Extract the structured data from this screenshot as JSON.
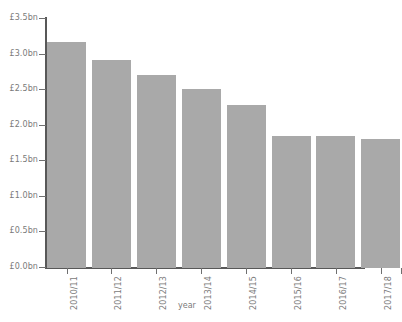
{
  "chart_data": {
    "type": "bar",
    "title": "",
    "xlabel": "year",
    "ylabel": "",
    "categories": [
      "2010/11",
      "2011/12",
      "2012/13",
      "2013/14",
      "2014/15",
      "2015/16",
      "2016/17",
      "2017/18"
    ],
    "values": [
      3.18,
      2.92,
      2.71,
      2.51,
      2.29,
      1.86,
      1.86,
      1.82
    ],
    "value_unit": "£bn",
    "ylim": [
      0,
      3.5
    ],
    "ytick_values": [
      0.0,
      0.5,
      1.0,
      1.5,
      2.0,
      2.5,
      3.0,
      3.5
    ],
    "ytick_labels": [
      "£0.0bn",
      "£0.5bn",
      "£1.0bn",
      "£1.5bn",
      "£2.0bn",
      "£2.5bn",
      "£3.0bn",
      "£3.5bn"
    ],
    "grid": false,
    "legend": null,
    "bar_color": "#a9a9a9",
    "axis_color": "#585858",
    "text_color": "#7a7a7a"
  },
  "axes": {
    "x_title": "year"
  }
}
